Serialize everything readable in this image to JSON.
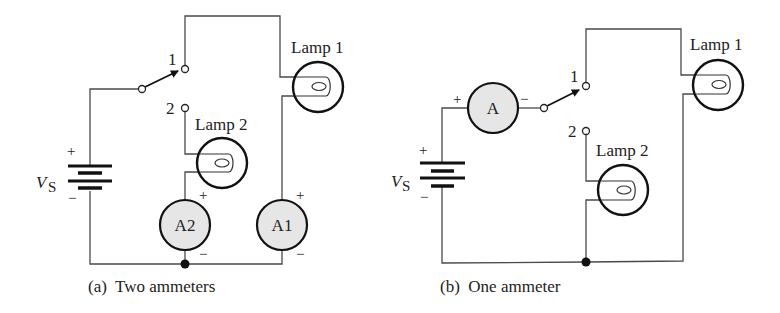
{
  "figure_a": {
    "caption": "(a)  Two ammeters",
    "source_label": "V",
    "source_subscript": "S",
    "source_plus": "+",
    "source_minus": "−",
    "switch_terminal_1": "1",
    "switch_terminal_2": "2",
    "lamp1_label": "Lamp 1",
    "lamp2_label": "Lamp 2",
    "ammeter1_label": "A1",
    "ammeter2_label": "A2",
    "ammeter_plus": "+",
    "ammeter_minus": "−"
  },
  "figure_b": {
    "caption": "(b)  One ammeter",
    "source_label": "V",
    "source_subscript": "S",
    "source_plus": "+",
    "source_minus": "−",
    "switch_terminal_1": "1",
    "switch_terminal_2": "2",
    "lamp1_label": "Lamp 1",
    "lamp2_label": "Lamp 2",
    "ammeter_label": "A",
    "ammeter_plus": "+",
    "ammeter_minus": "−"
  },
  "colors": {
    "wire": "#4a4a4a",
    "meter_fill": "#e6e6e6",
    "outline": "#111111"
  }
}
